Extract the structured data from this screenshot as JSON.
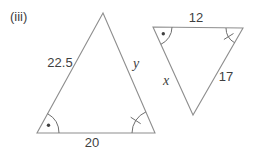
{
  "figure": {
    "item_label": "(iii)",
    "type": "similar-triangles-diagram"
  },
  "colors": {
    "line": "#8e8e8e",
    "text": "#3f3f3f",
    "mark": "#6e6e6e",
    "background": "#ffffff"
  },
  "left_triangle": {
    "side_labels": {
      "left": "22.5",
      "right": "y",
      "bottom": "20"
    },
    "angle_marks": {
      "bottom_left": "arc-with-dot",
      "bottom_right": "arc-with-tick"
    }
  },
  "right_triangle": {
    "side_labels": {
      "top": "12",
      "left": "x",
      "right": "17"
    },
    "angle_marks": {
      "top_left": "arc-with-dot",
      "top_right": "arc-with-tick"
    }
  }
}
